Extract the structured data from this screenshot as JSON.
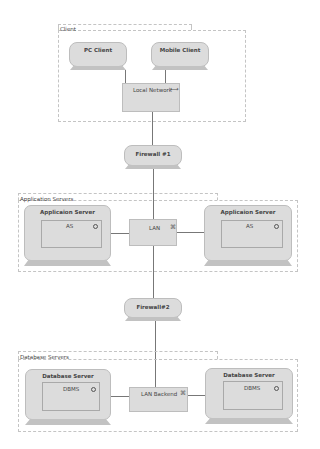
{
  "diagram": {
    "groups": {
      "client": {
        "label": "Client"
      },
      "app": {
        "label": "Application Servers"
      },
      "db": {
        "label": "Database Servers"
      }
    },
    "nodes": {
      "pc_client": {
        "label": "PC Client"
      },
      "mobile_client": {
        "label": "Mobile Client"
      },
      "firewall1": {
        "label": "Firewall #1"
      },
      "firewall2": {
        "label": "Firewall#2"
      },
      "app_server_left": {
        "label": "Applicaion Server",
        "inner": "AS"
      },
      "app_server_right": {
        "label": "Applicaion Server",
        "inner": "AS"
      },
      "db_server_left": {
        "label": "Database Server",
        "inner": "DBMS"
      },
      "db_server_right": {
        "label": "Database Server",
        "inner": "DBMS"
      }
    },
    "networks": {
      "local": {
        "label": "Local Network",
        "icon": "⟷"
      },
      "lan": {
        "label": "LAN",
        "icon": "⌘"
      },
      "lan_backend": {
        "label": "LAN Backend",
        "icon": "⌘"
      }
    },
    "colors": {
      "node_fill": "#dcdcdc",
      "node_border": "#bdbdbd",
      "base_fill": "#c2c2c2",
      "connector": "#777777",
      "group_border": "#c4c4c4"
    }
  }
}
